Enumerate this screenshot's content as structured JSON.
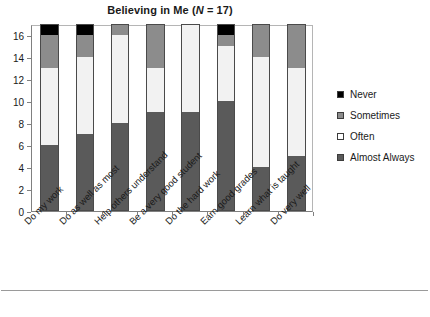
{
  "chart_data": {
    "type": "bar",
    "subtype": "stacked-vertical",
    "title": "Believing in Me (N = 17)",
    "title_parts": {
      "main": "Believing in Me (",
      "italic": "N",
      "tail": " = 17)"
    },
    "xlabel": "",
    "ylabel": "",
    "ylim": [
      0,
      17
    ],
    "yticks": [
      0,
      2,
      4,
      6,
      8,
      10,
      12,
      14,
      16
    ],
    "ytick_labels": [
      "0",
      "2",
      "4",
      "6",
      "8",
      "10",
      "12",
      "14",
      "16"
    ],
    "grid": false,
    "legend_position": "right",
    "total_n": 17,
    "categories": [
      "Do my work",
      "Do as well as most",
      "Help others understand",
      "Be a very good student",
      "Do the hard work",
      "Earn good grades",
      "Learn what is taught",
      "Do very well"
    ],
    "series": [
      {
        "name": "Almost Always",
        "color": "#5a5a5a",
        "values": [
          6,
          7,
          8,
          9,
          9,
          10,
          4,
          5
        ]
      },
      {
        "name": "Often",
        "color": "#f2f2f2",
        "values": [
          7,
          7,
          8,
          4,
          8,
          5,
          10,
          8
        ]
      },
      {
        "name": "Sometimes",
        "color": "#8c8c8c",
        "values": [
          3,
          2,
          1,
          4,
          0,
          1,
          3,
          4
        ]
      },
      {
        "name": "Never",
        "color": "#000000",
        "values": [
          1,
          1,
          0,
          0,
          0,
          1,
          0,
          0
        ]
      }
    ],
    "stack_order_bottom_to_top": [
      "Almost Always",
      "Often",
      "Sometimes",
      "Never"
    ],
    "legend_entries": [
      {
        "label": "Never",
        "color": "#000000"
      },
      {
        "label": "Sometimes",
        "color": "#8c8c8c"
      },
      {
        "label": "Often",
        "color": "#ffffff"
      },
      {
        "label": "Almost Always",
        "color": "#5a5a5a"
      }
    ]
  },
  "colors": {
    "never": "#000000",
    "sometimes": "#8c8c8c",
    "often": "#f4f4f4",
    "almost_always": "#5a5a5a",
    "axis": "#808080",
    "text": "#1a1a1a",
    "background": "#ffffff"
  }
}
